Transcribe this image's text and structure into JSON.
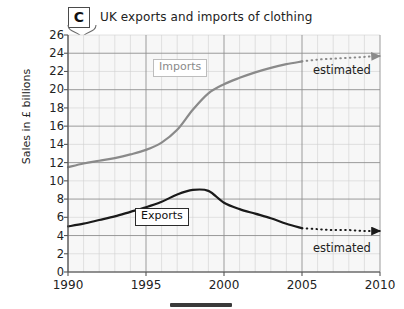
{
  "figure": {
    "tag_label": "C",
    "title": "UK exports and imports of clothing",
    "footer_mark": "bar-fragment"
  },
  "chart_data": {
    "type": "line",
    "title": "UK exports and imports of clothing",
    "xlabel": "",
    "ylabel": "Sales in £ billions",
    "xlim": [
      1990,
      2010
    ],
    "ylim": [
      0,
      26
    ],
    "x_tick_labels": [
      "1990",
      "1995",
      "2000",
      "2005",
      "2010"
    ],
    "x_tick_values": [
      1990,
      1995,
      2000,
      2005,
      2010
    ],
    "y_tick_labels": [
      "0",
      "2",
      "4",
      "6",
      "8",
      "10",
      "12",
      "14",
      "16",
      "18",
      "20",
      "22",
      "24",
      "26"
    ],
    "y_tick_values": [
      0,
      2,
      4,
      6,
      8,
      10,
      12,
      14,
      16,
      18,
      20,
      22,
      24,
      26
    ],
    "grid": true,
    "grid_minor_x_step": 1,
    "grid_major_x_step": 5,
    "grid_minor_y_step": 2,
    "grid_major_y_step": 4,
    "legend_position": "inline-labels",
    "annotations": [
      {
        "text": "estimated",
        "series": "Imports",
        "x": 2006.4,
        "y": 22.6
      },
      {
        "text": "estimated",
        "series": "Exports",
        "x": 2006.4,
        "y": 3.2
      }
    ],
    "series": [
      {
        "name": "Imports",
        "label": "Imports",
        "color": "#8a8a8a",
        "style": "solid",
        "x": [
          1990,
          1991,
          1992,
          1993,
          1994,
          1995,
          1996,
          1997,
          1998,
          1999,
          2000,
          2001,
          2002,
          2003,
          2004,
          2005
        ],
        "values": [
          11.5,
          11.9,
          12.2,
          12.5,
          12.9,
          13.4,
          14.2,
          15.6,
          17.8,
          19.6,
          20.6,
          21.3,
          21.9,
          22.4,
          22.8,
          23.1
        ]
      },
      {
        "name": "Imports (estimated)",
        "label": "estimated",
        "color": "#8a8a8a",
        "style": "dotted",
        "x": [
          2005,
          2006,
          2007,
          2008,
          2009,
          2010
        ],
        "values": [
          23.1,
          23.3,
          23.4,
          23.5,
          23.6,
          23.7
        ]
      },
      {
        "name": "Exports",
        "label": "Exports",
        "color": "#1a1a1a",
        "style": "solid",
        "x": [
          1990,
          1991,
          1992,
          1993,
          1994,
          1995,
          1996,
          1997,
          1998,
          1999,
          2000,
          2001,
          2002,
          2003,
          2004,
          2005
        ],
        "values": [
          5.0,
          5.3,
          5.7,
          6.1,
          6.6,
          7.1,
          7.7,
          8.5,
          9.0,
          8.9,
          7.6,
          6.9,
          6.4,
          5.9,
          5.3,
          4.8
        ]
      },
      {
        "name": "Exports (estimated)",
        "label": "estimated",
        "color": "#1a1a1a",
        "style": "dotted",
        "x": [
          2005,
          2006,
          2007,
          2008,
          2009,
          2010
        ],
        "values": [
          4.8,
          4.7,
          4.6,
          4.6,
          4.5,
          4.5
        ]
      }
    ]
  }
}
